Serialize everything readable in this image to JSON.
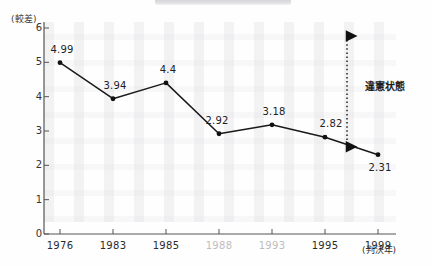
{
  "chart_data": {
    "type": "line",
    "title": "",
    "xlabel": "(判決年)",
    "ylabel": "(較差)",
    "categories": [
      "1976",
      "1983",
      "1985",
      "1988",
      "1993",
      "1995",
      "1999"
    ],
    "values": [
      4.99,
      3.94,
      4.4,
      2.92,
      3.18,
      2.82,
      2.31
    ],
    "point_labels": [
      "4.99",
      "3.94",
      "4.4",
      "2.92",
      "3.18",
      "2.82",
      "2.31"
    ],
    "ylim": [
      0,
      6
    ],
    "yticks": [
      "0",
      "1",
      "2",
      "3",
      "4",
      "5",
      "6"
    ],
    "dim_categories": [
      "1988",
      "1993"
    ],
    "grid": false,
    "legend": "none",
    "annotations": [
      {
        "text": "違憲状態",
        "kind": "range-arrow",
        "from_value": 2.31,
        "to_value": 6.0
      }
    ]
  },
  "axis": {
    "y_unit_label": "(較差)",
    "x_unit_label": "(判決年)"
  },
  "annotation": {
    "unconstitutional_label": "違憲状態"
  },
  "colors": {
    "line": "#1a1a1a",
    "marker": "#111111",
    "axis": "#555555",
    "text": "#222222",
    "dim_text": "#bdbdbd",
    "top_bar": "#d8d8da"
  }
}
